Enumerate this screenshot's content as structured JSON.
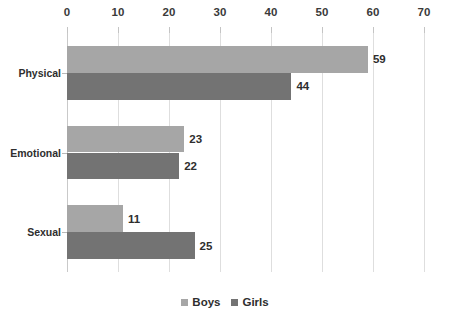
{
  "chart_data": {
    "type": "bar",
    "orientation": "horizontal",
    "title": "",
    "subtitle": "",
    "xlabel": "",
    "ylabel": "",
    "categories": [
      "Physical",
      "Emotional",
      "Sexual"
    ],
    "series": [
      {
        "name": "Boys",
        "values": [
          59,
          23,
          11
        ],
        "color": "#a6a6a6"
      },
      {
        "name": "Girls",
        "values": [
          44,
          22,
          25
        ],
        "color": "#737373"
      }
    ],
    "xlim": [
      0,
      70
    ],
    "xticks": [
      0,
      10,
      20,
      30,
      40,
      50,
      60,
      70
    ],
    "xtick_labels": [
      "0",
      "10",
      "20",
      "30",
      "40",
      "50",
      "60",
      "70"
    ],
    "axis_position": "top",
    "grid": {
      "vertical": true,
      "horizontal": false,
      "color": "#dedede"
    },
    "data_labels": {
      "shown": true,
      "values": [
        [
          "59",
          "44"
        ],
        [
          "23",
          "22"
        ],
        [
          "11",
          "25"
        ]
      ]
    },
    "legend": {
      "position": "bottom-center",
      "entries": [
        {
          "label": "Boys",
          "color": "#a6a6a6"
        },
        {
          "label": "Girls",
          "color": "#737373"
        }
      ]
    },
    "background": "#ffffff"
  }
}
